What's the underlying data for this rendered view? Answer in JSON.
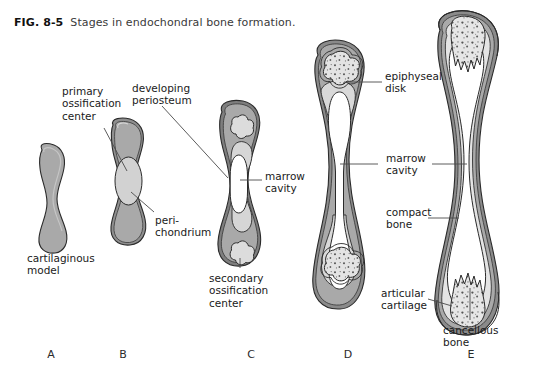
{
  "figure": {
    "number": "FIG. 8-5",
    "caption": "Stages in endochondral bone formation."
  },
  "labels": {
    "primary_ossification_center": "primary\nossification\ncenter",
    "developing_periosteum": "developing\nperiosteum",
    "perichondrium": "peri-\nchondrium",
    "cartilaginous_model": "cartilaginous\nmodel",
    "marrow_cavity_c": "marrow\ncavity",
    "secondary_ossification_center": "secondary\nossification\ncenter",
    "epiphyseal_disk": "epiphyseal\ndisk",
    "marrow_cavity_de": "marrow\ncavity",
    "compact_bone": "compact\nbone",
    "articular_cartilage": "articular\ncartilage",
    "cancellous_bone": "cancellous\nbone"
  },
  "stages": [
    {
      "letter": "A",
      "name": "cartilaginous model"
    },
    {
      "letter": "B",
      "name": "primary ossification center forming"
    },
    {
      "letter": "C",
      "name": "secondary ossification centers forming"
    },
    {
      "letter": "D",
      "name": "epiphyseal disks present"
    },
    {
      "letter": "E",
      "name": "mature bone"
    }
  ],
  "colors": {
    "cartilage_gray": "#a9a9a9",
    "light_gray": "#d2d2d2",
    "pale_gray": "#e2e2e2",
    "marrow_white": "#ffffff",
    "outline": "#2a2a2a",
    "leader_line": "#4a4a4a",
    "background": "#ffffff"
  }
}
